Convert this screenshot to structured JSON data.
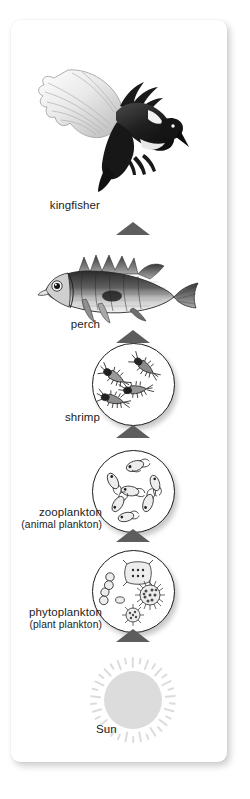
{
  "diagram": {
    "orientation": "vertical, arrows point upward from energy source to top predator",
    "background_color": "#ffffff",
    "card_color": "#ffffff",
    "arrow_color": "#5d5d5d",
    "text_color": "#1b1b1b",
    "sun_color": "#dcdcdc"
  },
  "levels": [
    {
      "id": "kingfisher",
      "label": "kingfisher",
      "sublabel": "",
      "illustration": "kingfisher-bird-illustration",
      "order": 6
    },
    {
      "id": "perch",
      "label": "perch",
      "sublabel": "",
      "illustration": "perch-fish-illustration",
      "order": 5
    },
    {
      "id": "shrimp",
      "label": "shrimp",
      "sublabel": "",
      "illustration": "shrimp-microscope-circle",
      "order": 4
    },
    {
      "id": "zooplankton",
      "label": "zooplankton",
      "sublabel": "(animal plankton)",
      "illustration": "zooplankton-microscope-circle",
      "order": 3
    },
    {
      "id": "phytoplankton",
      "label": "phytoplankton",
      "sublabel": "(plant plankton)",
      "illustration": "phytoplankton-microscope-circle",
      "order": 2
    },
    {
      "id": "sun",
      "label": "Sun",
      "sublabel": "",
      "illustration": "sun-with-rays",
      "order": 1
    }
  ],
  "arrows": [
    {
      "id": "arrow-perch-to-kingfisher",
      "from": "perch",
      "to": "kingfisher",
      "glyph": "triangle-up-icon"
    },
    {
      "id": "arrow-shrimp-to-perch",
      "from": "shrimp",
      "to": "perch",
      "glyph": "triangle-up-icon"
    },
    {
      "id": "arrow-zooplankton-to-shrimp",
      "from": "zooplankton",
      "to": "shrimp",
      "glyph": "triangle-up-icon"
    },
    {
      "id": "arrow-phytoplankton-to-zooplankton",
      "from": "phytoplankton",
      "to": "zooplankton",
      "glyph": "triangle-up-icon"
    },
    {
      "id": "arrow-sun-to-phytoplankton",
      "from": "sun",
      "to": "phytoplankton",
      "glyph": "triangle-up-icon"
    }
  ]
}
